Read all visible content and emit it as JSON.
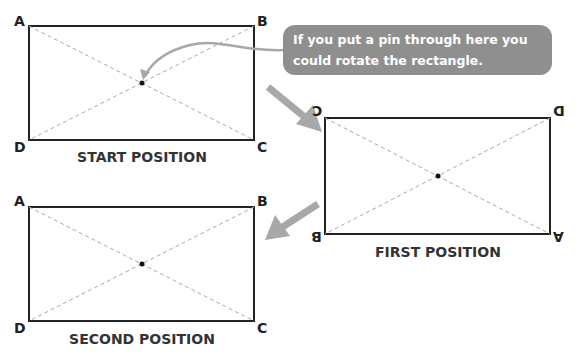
{
  "callout": {
    "line1": "If you put a pin through here you",
    "line2": "could rotate the rectangle."
  },
  "start": {
    "caption": "START POSITION",
    "corners": {
      "top_left": "A",
      "top_right": "B",
      "bottom_left": "D",
      "bottom_right": "C"
    }
  },
  "first": {
    "caption": "FIRST POSITION",
    "corners": {
      "top_left": "C",
      "top_right": "D",
      "bottom_left": "B",
      "bottom_right": "A"
    }
  },
  "second": {
    "caption": "SECOND POSITION",
    "corners": {
      "top_left": "A",
      "top_right": "B",
      "bottom_left": "D",
      "bottom_right": "C"
    }
  },
  "colors": {
    "arrow": "#a8a8a8",
    "bubble": "#8f8f8f",
    "diagonal": "#aaaaaa"
  }
}
